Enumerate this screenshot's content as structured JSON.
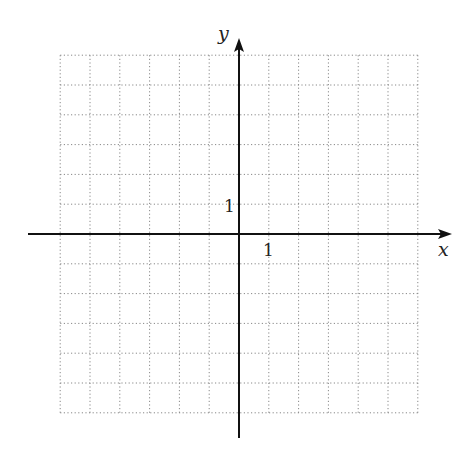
{
  "diagram": {
    "type": "coordinate-grid",
    "x_axis_label": "x",
    "y_axis_label": "y",
    "x_tick_label": "1",
    "y_tick_label": "1",
    "grid": {
      "x_min": -6,
      "x_max": 6,
      "y_min": -6,
      "y_max": 6,
      "step": 1,
      "style": "dotted"
    },
    "colors": {
      "axis": "#111111",
      "grid": "#888888",
      "text": "#222222"
    }
  }
}
